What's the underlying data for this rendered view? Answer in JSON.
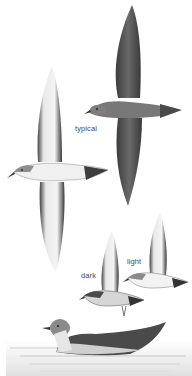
{
  "plate": {
    "subject": "shearwater field-guide illustration",
    "figures": [
      {
        "id": "dark-bird-upperside",
        "pose": "flying, upperside view",
        "color": "#5a5a5a"
      },
      {
        "id": "typical-underside",
        "pose": "flying, underside view",
        "label": "typical"
      },
      {
        "id": "dark-small",
        "pose": "flying, underside, small",
        "label": "dark"
      },
      {
        "id": "light-small",
        "pose": "flying, underside, small",
        "label": "light"
      },
      {
        "id": "swimming-bird",
        "pose": "sitting on water"
      }
    ]
  },
  "labels": {
    "typical": "typical",
    "dark": "dark",
    "light": "light"
  },
  "colors": {
    "background": "#ffffff",
    "dark_plumage": "#4e4e4e",
    "mid_plumage": "#8a8a8a",
    "pale_plumage": "#f2f2f2",
    "water": "#d8d8d8",
    "label_text": "#4a4a4a"
  }
}
